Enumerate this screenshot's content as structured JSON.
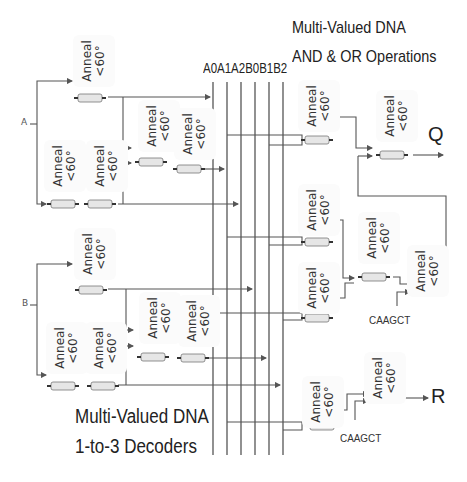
{
  "titles": {
    "and_or_line1": "Multi-Valued DNA",
    "and_or_line2": "AND & OR Operations",
    "decoder_line1": "Multi-Valued DNA",
    "decoder_line2": "1-to-3 Decoders"
  },
  "bus": {
    "label": "A0A1A2B0B1B2",
    "lines": [
      "A0",
      "A1",
      "A2",
      "B0",
      "B1",
      "B2"
    ]
  },
  "inputs": {
    "a": "A",
    "b": "B"
  },
  "outputs": {
    "q": "Q",
    "r": "R"
  },
  "sequences": {
    "seq1": "CAAGCT",
    "seq2": "CAAGCT"
  },
  "anneal": {
    "line1": "Anneal",
    "line2": "<60°",
    "boxes": [
      {
        "id": "a-top"
      },
      {
        "id": "a-left"
      },
      {
        "id": "a-mid"
      },
      {
        "id": "a-mid2"
      },
      {
        "id": "a-right"
      },
      {
        "id": "b-top"
      },
      {
        "id": "b-left"
      },
      {
        "id": "b-mid"
      },
      {
        "id": "b-mid2"
      },
      {
        "id": "b-right"
      },
      {
        "id": "g1"
      },
      {
        "id": "g2"
      },
      {
        "id": "g3"
      },
      {
        "id": "g4"
      },
      {
        "id": "g5"
      },
      {
        "id": "g6"
      },
      {
        "id": "g7"
      },
      {
        "id": "g8"
      }
    ]
  },
  "colors": {
    "line": "#555555",
    "text": "#222222",
    "box": "#fbfbfb",
    "gene": "#e6e6e6"
  }
}
